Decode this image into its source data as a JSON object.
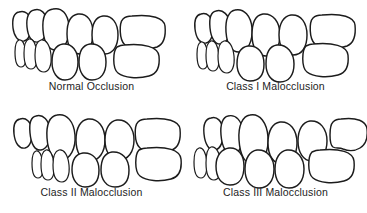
{
  "figure": {
    "background_color": "#ffffff",
    "line_color": "#1c1c1c",
    "caption_color": "#232323",
    "panel_count": 4,
    "layout": "2x2-grid"
  },
  "panels": [
    {
      "id": "normal-occlusion",
      "caption": "Normal Occlusion",
      "position": "top-left",
      "description": "Upper and lower molars interdigitate correctly; upper incisors slightly overlap lower incisors.",
      "upper_arch_tooth_count": 6,
      "lower_arch_tooth_count": 6,
      "lower_arch_offset": "aligned"
    },
    {
      "id": "class-i-malocclusion",
      "caption": "Class I Malocclusion",
      "position": "top-right",
      "description": "Molar relationship is normal but teeth are crowded or rotated.",
      "upper_arch_tooth_count": 6,
      "lower_arch_tooth_count": 6,
      "lower_arch_offset": "aligned-crowded"
    },
    {
      "id": "class-ii-malocclusion",
      "caption": "Class II Malocclusion",
      "position": "bottom-left",
      "description": "Lower arch is retruded; upper incisors protrude well ahead of lower incisors (overbite).",
      "upper_arch_tooth_count": 6,
      "lower_arch_tooth_count": 6,
      "lower_arch_offset": "retruded"
    },
    {
      "id": "class-iii-malocclusion",
      "caption": "Class III Malocclusion",
      "position": "bottom-right",
      "description": "Lower arch is protruded; lower incisors sit ahead of upper incisors (underbite).",
      "upper_arch_tooth_count": 6,
      "lower_arch_tooth_count": 6,
      "lower_arch_offset": "protruded"
    }
  ]
}
